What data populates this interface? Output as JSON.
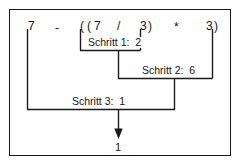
{
  "diagram": {
    "border_color": "#1a1a1a",
    "line_color": "#1a1a1a",
    "text_color": "#161616",
    "background": "#ffffff"
  },
  "expression": {
    "full": "7 - ( ( 7 / 3 ) * 3 )",
    "tokens": [
      {
        "text": "7",
        "x": 28,
        "y": 20
      },
      {
        "text": "-",
        "x": 55,
        "y": 22
      },
      {
        "text": "(",
        "x": 80,
        "y": 20
      },
      {
        "text": "(",
        "x": 87,
        "y": 20
      },
      {
        "text": "7",
        "x": 94,
        "y": 20
      },
      {
        "text": "/",
        "x": 117,
        "y": 20
      },
      {
        "text": "3",
        "x": 140,
        "y": 20
      },
      {
        "text": ")",
        "x": 148,
        "y": 20
      },
      {
        "text": "*",
        "x": 174,
        "y": 21
      },
      {
        "text": "3",
        "x": 206,
        "y": 20
      },
      {
        "text": ")",
        "x": 214,
        "y": 20
      }
    ]
  },
  "steps": [
    {
      "id": "step1",
      "label": "Schritt 1:",
      "value": "2",
      "text": "Schritt 1:  2",
      "operation": "7 / 3",
      "result": 2
    },
    {
      "id": "step2",
      "label": "Schritt 2:",
      "value": "6",
      "text": "Schritt 2:  6",
      "operation": "2 * 3",
      "result": 6
    },
    {
      "id": "step3",
      "label": "Schritt 3:",
      "value": "1",
      "text": "Schritt 3:  1",
      "operation": "7 - 6",
      "result": 1
    }
  ],
  "final_result": {
    "label": "1",
    "value": 1
  }
}
